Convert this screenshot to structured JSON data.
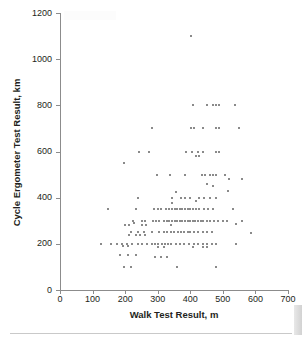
{
  "chart_data": {
    "type": "scatter",
    "title": "",
    "xlabel": "Walk Test Result, m",
    "ylabel": "Cycle Ergometer Test Result, km",
    "xlim": [
      0,
      700
    ],
    "ylim": [
      0,
      1200
    ],
    "xticks": [
      0,
      100,
      200,
      300,
      400,
      500,
      600,
      700
    ],
    "yticks": [
      0,
      200,
      400,
      600,
      800,
      1000,
      1200
    ],
    "grid": false,
    "legend": null,
    "marker": {
      "shape": "square",
      "color": "#8a8a8a",
      "size_px": 2
    },
    "point_count": 189,
    "annotations": [],
    "points": [
      [
        402,
        1100
      ],
      [
        407,
        800
      ],
      [
        452,
        800
      ],
      [
        470,
        800
      ],
      [
        478,
        800
      ],
      [
        487,
        800
      ],
      [
        538,
        800
      ],
      [
        283,
        700
      ],
      [
        403,
        700
      ],
      [
        412,
        700
      ],
      [
        440,
        700
      ],
      [
        478,
        700
      ],
      [
        487,
        700
      ],
      [
        550,
        700
      ],
      [
        243,
        600
      ],
      [
        272,
        600
      ],
      [
        388,
        600
      ],
      [
        406,
        600
      ],
      [
        423,
        600
      ],
      [
        438,
        600
      ],
      [
        480,
        600
      ],
      [
        489,
        600
      ],
      [
        418,
        580
      ],
      [
        428,
        580
      ],
      [
        196,
        550
      ],
      [
        297,
        500
      ],
      [
        337,
        500
      ],
      [
        385,
        500
      ],
      [
        437,
        500
      ],
      [
        445,
        500
      ],
      [
        460,
        500
      ],
      [
        470,
        500
      ],
      [
        478,
        500
      ],
      [
        506,
        500
      ],
      [
        560,
        480
      ],
      [
        520,
        480
      ],
      [
        452,
        460
      ],
      [
        470,
        450
      ],
      [
        515,
        430
      ],
      [
        355,
        425
      ],
      [
        238,
        400
      ],
      [
        345,
        400
      ],
      [
        372,
        400
      ],
      [
        385,
        400
      ],
      [
        400,
        400
      ],
      [
        428,
        400
      ],
      [
        443,
        400
      ],
      [
        460,
        400
      ],
      [
        478,
        400
      ],
      [
        418,
        385
      ],
      [
        345,
        375
      ],
      [
        148,
        350
      ],
      [
        232,
        350
      ],
      [
        290,
        350
      ],
      [
        300,
        350
      ],
      [
        310,
        350
      ],
      [
        325,
        350
      ],
      [
        335,
        350
      ],
      [
        345,
        350
      ],
      [
        352,
        350
      ],
      [
        360,
        350
      ],
      [
        368,
        350
      ],
      [
        375,
        350
      ],
      [
        383,
        350
      ],
      [
        392,
        350
      ],
      [
        400,
        350
      ],
      [
        408,
        350
      ],
      [
        418,
        350
      ],
      [
        428,
        350
      ],
      [
        443,
        350
      ],
      [
        455,
        350
      ],
      [
        470,
        350
      ],
      [
        530,
        350
      ],
      [
        223,
        300
      ],
      [
        252,
        300
      ],
      [
        262,
        300
      ],
      [
        285,
        300
      ],
      [
        295,
        300
      ],
      [
        305,
        300
      ],
      [
        318,
        300
      ],
      [
        328,
        300
      ],
      [
        336,
        300
      ],
      [
        345,
        300
      ],
      [
        352,
        300
      ],
      [
        360,
        300
      ],
      [
        368,
        300
      ],
      [
        376,
        300
      ],
      [
        384,
        300
      ],
      [
        392,
        300
      ],
      [
        400,
        300
      ],
      [
        408,
        300
      ],
      [
        416,
        300
      ],
      [
        424,
        300
      ],
      [
        432,
        300
      ],
      [
        440,
        300
      ],
      [
        450,
        300
      ],
      [
        462,
        300
      ],
      [
        472,
        300
      ],
      [
        486,
        300
      ],
      [
        500,
        300
      ],
      [
        512,
        300
      ],
      [
        560,
        300
      ],
      [
        228,
        290
      ],
      [
        540,
        285
      ],
      [
        200,
        280
      ],
      [
        212,
        280
      ],
      [
        252,
        280
      ],
      [
        263,
        280
      ],
      [
        340,
        280
      ],
      [
        585,
        245
      ],
      [
        218,
        250
      ],
      [
        238,
        250
      ],
      [
        258,
        250
      ],
      [
        282,
        250
      ],
      [
        305,
        250
      ],
      [
        318,
        250
      ],
      [
        330,
        250
      ],
      [
        340,
        250
      ],
      [
        350,
        250
      ],
      [
        362,
        250
      ],
      [
        372,
        250
      ],
      [
        382,
        250
      ],
      [
        392,
        250
      ],
      [
        400,
        250
      ],
      [
        412,
        250
      ],
      [
        424,
        250
      ],
      [
        440,
        250
      ],
      [
        452,
        250
      ],
      [
        466,
        250
      ],
      [
        212,
        240
      ],
      [
        232,
        240
      ],
      [
        245,
        240
      ],
      [
        262,
        240
      ],
      [
        126,
        200
      ],
      [
        158,
        200
      ],
      [
        175,
        200
      ],
      [
        190,
        200
      ],
      [
        205,
        200
      ],
      [
        222,
        200
      ],
      [
        238,
        200
      ],
      [
        252,
        200
      ],
      [
        268,
        200
      ],
      [
        282,
        200
      ],
      [
        292,
        200
      ],
      [
        302,
        200
      ],
      [
        312,
        200
      ],
      [
        322,
        200
      ],
      [
        332,
        200
      ],
      [
        342,
        200
      ],
      [
        356,
        200
      ],
      [
        368,
        200
      ],
      [
        380,
        200
      ],
      [
        396,
        200
      ],
      [
        410,
        200
      ],
      [
        424,
        200
      ],
      [
        440,
        200
      ],
      [
        452,
        200
      ],
      [
        466,
        200
      ],
      [
        480,
        200
      ],
      [
        540,
        200
      ],
      [
        192,
        190
      ],
      [
        208,
        190
      ],
      [
        300,
        185
      ],
      [
        318,
        185
      ],
      [
        408,
        185
      ],
      [
        440,
        185
      ],
      [
        452,
        185
      ],
      [
        185,
        150
      ],
      [
        208,
        150
      ],
      [
        232,
        150
      ],
      [
        292,
        145
      ],
      [
        310,
        145
      ],
      [
        328,
        145
      ],
      [
        196,
        100
      ],
      [
        218,
        100
      ],
      [
        358,
        100
      ],
      [
        478,
        100
      ]
    ]
  }
}
